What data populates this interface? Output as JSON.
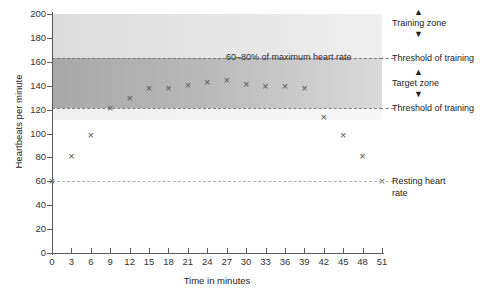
{
  "title_fragment": "",
  "chart_data": {
    "type": "scatter",
    "title": "",
    "xlabel": "Time in minutes",
    "ylabel": "Heartbeats per minute",
    "xlim": [
      0,
      51
    ],
    "ylim": [
      0,
      200
    ],
    "xticks": [
      0,
      3,
      6,
      9,
      12,
      15,
      18,
      21,
      24,
      27,
      30,
      33,
      36,
      39,
      42,
      45,
      48,
      51
    ],
    "yticks": [
      0,
      20,
      40,
      60,
      80,
      100,
      120,
      140,
      160,
      180,
      200
    ],
    "grid": false,
    "legend_position": "right",
    "series": [
      {
        "name": "Heart rate",
        "marker": "x",
        "color": "#555555",
        "x": [
          0,
          3,
          6,
          9,
          12,
          15,
          18,
          21,
          24,
          27,
          30,
          33,
          36,
          39,
          42,
          45,
          48,
          51
        ],
        "y": [
          60,
          81,
          98,
          121,
          129,
          138,
          138,
          140,
          143,
          144,
          141,
          139,
          139,
          138,
          113,
          98,
          81,
          60
        ]
      }
    ],
    "bands": [
      {
        "name": "Training zone",
        "y_from": 163,
        "y_to": 200,
        "color": "#e2e2e2"
      },
      {
        "name": "Target zone",
        "y_from": 121,
        "y_to": 163,
        "color": "#b4b4b4"
      }
    ],
    "threshold_lines": [
      {
        "name": "Upper threshold of training",
        "y": 163,
        "style": "dashed"
      },
      {
        "name": "Lower threshold of training",
        "y": 121,
        "style": "dashed"
      },
      {
        "name": "Resting heart rate",
        "y": 60,
        "style": "dashed"
      }
    ],
    "annotations": [
      {
        "text": "60–80% of maximum heart rate",
        "x": 27,
        "y": 152
      }
    ]
  },
  "legend": {
    "training_zone": "Training zone",
    "threshold_upper": "Threshold of training",
    "target_zone": "Target zone",
    "threshold_lower": "Threshold of training",
    "resting_line1": "Resting heart",
    "resting_line2": "rate",
    "arrow_up": "▲",
    "arrow_down": "▼"
  }
}
